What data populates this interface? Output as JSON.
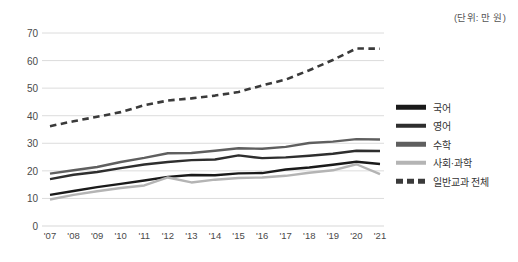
{
  "unit_note": "(단위: 만 원)",
  "legend": {
    "items": [
      {
        "label": "국어",
        "color": "#1a1a1a",
        "style": "solid"
      },
      {
        "label": "영어",
        "color": "#2e2e2e",
        "style": "solid"
      },
      {
        "label": "수학",
        "color": "#5f5f5f",
        "style": "solid"
      },
      {
        "label": "사회·과학",
        "color": "#b4b4b4",
        "style": "solid"
      },
      {
        "label": "일반교과 전체",
        "color": "#3a3a3a",
        "style": "dashed"
      }
    ]
  },
  "chart_data": {
    "type": "line",
    "title": "",
    "subtitle": "",
    "xlabel": "",
    "ylabel": "",
    "unit": "(단위: 만 원)",
    "grid": true,
    "legend_position": "right",
    "ylim": [
      0,
      70
    ],
    "yticks": [
      0,
      10,
      20,
      30,
      40,
      50,
      60,
      70
    ],
    "ytick_labels": [
      "0",
      "10",
      "20",
      "30",
      "40",
      "50",
      "60",
      "70"
    ],
    "categories": [
      "'07",
      "'08",
      "'09",
      "'10",
      "'11",
      "'12",
      "'13",
      "'14",
      "'15",
      "'16",
      "'17",
      "'18",
      "'19",
      "'20",
      "'21"
    ],
    "series": [
      {
        "name": "국어",
        "color": "#1a1a1a",
        "style": "solid",
        "values": [
          11.3,
          12.7,
          14.1,
          15.3,
          16.5,
          17.8,
          18.5,
          18.4,
          19.1,
          19.2,
          20.5,
          21.2,
          22.2,
          23.3,
          22.5
        ]
      },
      {
        "name": "영어",
        "color": "#2e2e2e",
        "style": "solid",
        "values": [
          17.0,
          18.6,
          19.6,
          21.0,
          22.3,
          23.2,
          23.9,
          24.1,
          25.6,
          24.6,
          24.9,
          25.5,
          26.2,
          27.3,
          27.2
        ]
      },
      {
        "name": "수학",
        "color": "#5f5f5f",
        "style": "solid",
        "values": [
          19.0,
          20.2,
          21.4,
          23.2,
          24.7,
          26.4,
          26.5,
          27.3,
          28.2,
          28.0,
          28.7,
          30.1,
          30.6,
          31.5,
          31.4
        ]
      },
      {
        "name": "사회·과학",
        "color": "#b4b4b4",
        "style": "solid",
        "values": [
          9.6,
          11.3,
          12.6,
          13.8,
          14.7,
          17.6,
          15.8,
          16.8,
          17.4,
          17.6,
          18.2,
          19.3,
          20.2,
          22.4,
          18.8
        ]
      },
      {
        "name": "일반교과 전체",
        "color": "#3a3a3a",
        "style": "dashed",
        "values": [
          36.2,
          38.0,
          39.6,
          41.3,
          43.8,
          45.5,
          46.3,
          47.3,
          48.6,
          51.0,
          53.1,
          56.5,
          60.2,
          64.4,
          64.3
        ]
      }
    ]
  }
}
